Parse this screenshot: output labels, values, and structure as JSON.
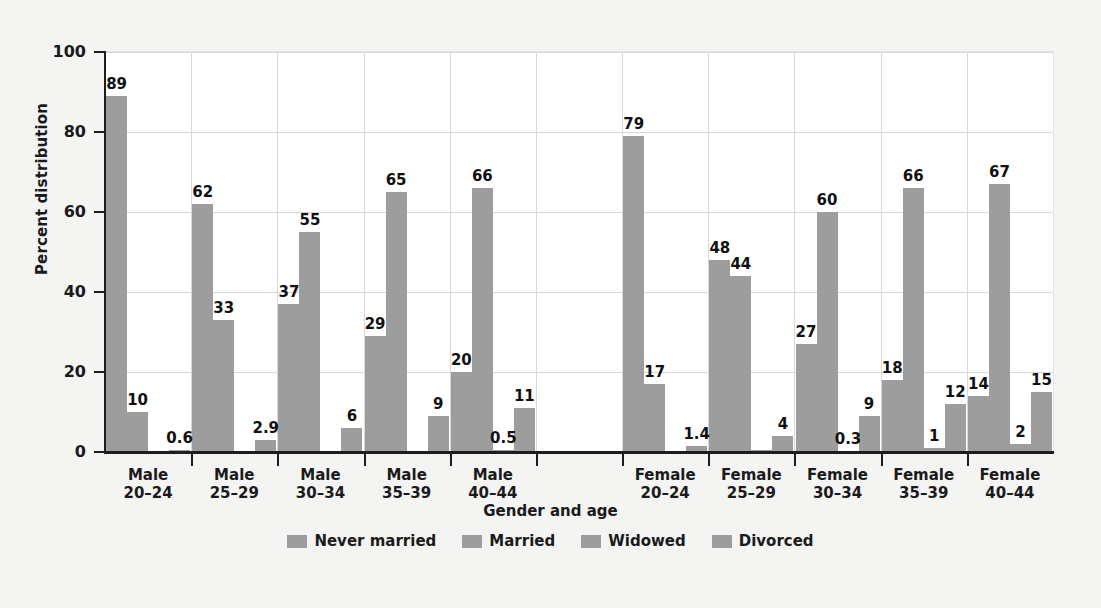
{
  "chart_data": {
    "type": "bar",
    "title": "",
    "xlabel": "Gender and age",
    "ylabel": "Percent distribution",
    "ylim": [
      0,
      100
    ],
    "yticks": [
      0,
      20,
      40,
      60,
      80,
      100
    ],
    "ytick_labels": [
      "0",
      "20",
      "40",
      "60",
      "80",
      "100"
    ],
    "grid": true,
    "legend_position": "bottom",
    "categories": [
      "Male 20–24",
      "Male 25–29",
      "Male 30–34",
      "Male 35–39",
      "Male 40–44",
      "Female 20–24",
      "Female 25–29",
      "Female 30–34",
      "Female 35–39",
      "Female 40–44"
    ],
    "category_lines": [
      [
        "Male",
        "20–24"
      ],
      [
        "Male",
        "25–29"
      ],
      [
        "Male",
        "30–34"
      ],
      [
        "Male",
        "35–39"
      ],
      [
        "Male",
        "40–44"
      ],
      [
        "Female",
        "20–24"
      ],
      [
        "Female",
        "25–29"
      ],
      [
        "Female",
        "30–34"
      ],
      [
        "Female",
        "35–39"
      ],
      [
        "Female",
        "40–44"
      ]
    ],
    "series": [
      {
        "name": "Never married",
        "values": [
          89,
          62,
          37,
          29,
          20,
          79,
          48,
          27,
          18,
          14
        ],
        "labels": [
          "89",
          "62",
          "37",
          "29",
          "20",
          "79",
          "48",
          "27",
          "18",
          "14"
        ]
      },
      {
        "name": "Married",
        "values": [
          10,
          33,
          55,
          65,
          66,
          17,
          44,
          60,
          66,
          67
        ],
        "labels": [
          "10",
          "33",
          "55",
          "65",
          "66",
          "17",
          "44",
          "60",
          "66",
          "67"
        ]
      },
      {
        "name": "Widowed",
        "values": [
          0.1,
          0.1,
          0.2,
          0.2,
          0.5,
          0.2,
          0.4,
          0.3,
          1,
          2
        ],
        "labels": [
          "",
          "",
          "",
          "",
          "0.5",
          "",
          "",
          "0.3",
          "1",
          "2"
        ]
      },
      {
        "name": "Divorced",
        "values": [
          0.6,
          2.9,
          6,
          9,
          11,
          1.4,
          4,
          9,
          12,
          15
        ],
        "labels": [
          "0.6",
          "2.9",
          "6",
          "9",
          "11",
          "1.4",
          "4",
          "9",
          "12",
          "15"
        ]
      }
    ],
    "series_color": "#9d9d9d",
    "legend": [
      "Never married",
      "Married",
      "Widowed",
      "Divorced"
    ]
  }
}
